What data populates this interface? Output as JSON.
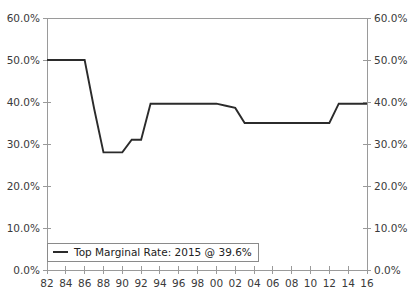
{
  "chart_data": {
    "type": "line",
    "title": "",
    "xlabel": "",
    "ylabel": "",
    "xlim": [
      1982,
      2016
    ],
    "ylim": [
      0,
      60
    ],
    "grid": false,
    "legend_position": "bottom-left",
    "y_axis_left": {
      "ticks": [
        0,
        10,
        20,
        30,
        40,
        50,
        60
      ],
      "tick_labels": [
        "0.0%",
        "10.0%",
        "20.0%",
        "30.0%",
        "40.0%",
        "50.0%",
        "60.0%"
      ]
    },
    "y_axis_right": {
      "ticks": [
        0,
        10,
        20,
        30,
        40,
        50,
        60
      ],
      "tick_labels": [
        "0.0%",
        "10.0%",
        "20.0%",
        "30.0%",
        "40.0%",
        "50.0%",
        "60.0%"
      ]
    },
    "x_axis": {
      "ticks": [
        1982,
        1984,
        1986,
        1988,
        1990,
        1992,
        1994,
        1996,
        1998,
        2000,
        2002,
        2004,
        2006,
        2008,
        2010,
        2012,
        2014,
        2016
      ],
      "tick_labels": [
        "82",
        "84",
        "86",
        "88",
        "90",
        "92",
        "94",
        "96",
        "98",
        "00",
        "02",
        "04",
        "06",
        "08",
        "10",
        "12",
        "14",
        "16"
      ]
    },
    "series": [
      {
        "name": "Top Marginal Rate: 2015 @ 39.6%",
        "color": "#2b2b2b",
        "x": [
          1982,
          1983,
          1984,
          1985,
          1986,
          1987,
          1988,
          1989,
          1990,
          1991,
          1992,
          1993,
          1994,
          1995,
          1996,
          1997,
          1998,
          1999,
          2000,
          2001,
          2002,
          2003,
          2004,
          2005,
          2006,
          2007,
          2008,
          2009,
          2010,
          2011,
          2012,
          2013,
          2014,
          2015,
          2016
        ],
        "values": [
          50.0,
          50.0,
          50.0,
          50.0,
          50.0,
          38.5,
          28.0,
          28.0,
          28.0,
          31.0,
          31.0,
          39.6,
          39.6,
          39.6,
          39.6,
          39.6,
          39.6,
          39.6,
          39.6,
          39.1,
          38.6,
          35.0,
          35.0,
          35.0,
          35.0,
          35.0,
          35.0,
          35.0,
          35.0,
          35.0,
          35.0,
          39.6,
          39.6,
          39.6,
          39.6
        ]
      }
    ]
  },
  "legend": {
    "entries": [
      {
        "label": "Top Marginal Rate: 2015 @ 39.6%"
      }
    ]
  }
}
